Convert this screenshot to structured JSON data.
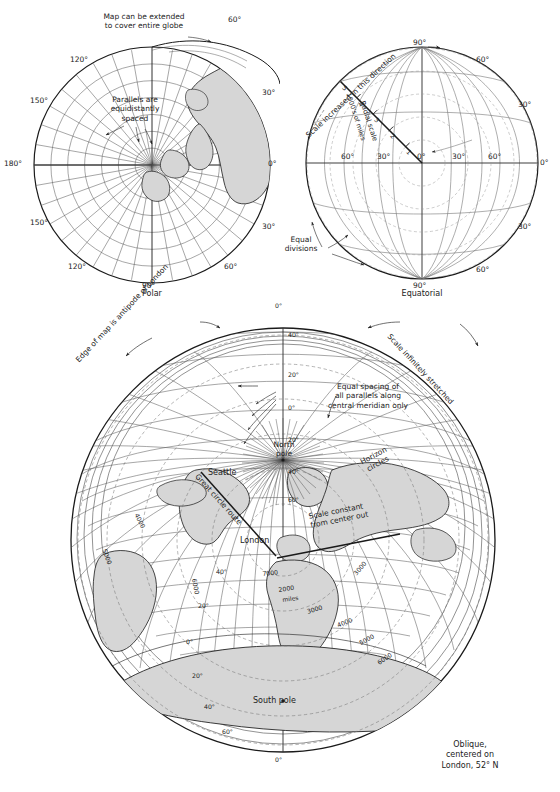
{
  "figure": {
    "header_faint": "",
    "panels": [
      {
        "id": "polar",
        "caption": "Polar"
      },
      {
        "id": "equatorial",
        "caption": "Equatorial"
      },
      {
        "id": "oblique",
        "caption": "Oblique,\ncentered on\nLondon, 52° N"
      }
    ]
  },
  "polar": {
    "caption": "Polar",
    "annotations": [
      {
        "name": "map-extent-note",
        "text": "Map can be extended\nto cover entire globe"
      },
      {
        "name": "parallels-note",
        "text": "Parallels are\nequidistantly\nspaced"
      }
    ],
    "meridian_labels": [
      {
        "text": "60°",
        "pos": "top-right"
      },
      {
        "text": "30°",
        "pos": "upper-right"
      },
      {
        "text": "0°",
        "pos": "right"
      },
      {
        "text": "30°",
        "pos": "lower-right"
      },
      {
        "text": "60°",
        "pos": "bottom-right"
      },
      {
        "text": "90°",
        "pos": "bottom"
      },
      {
        "text": "120°",
        "pos": "bottom-left"
      },
      {
        "text": "150°",
        "pos": "lower-left"
      },
      {
        "text": "180°",
        "pos": "left"
      },
      {
        "text": "150°",
        "pos": "upper-left"
      },
      {
        "text": "120°",
        "pos": "top-left"
      }
    ]
  },
  "equatorial": {
    "caption": "Equatorial",
    "annotations": [
      {
        "name": "scale-direction-note",
        "text": "Scale increased in this direction"
      },
      {
        "name": "radial-scale-label",
        "text": "Radial scale"
      },
      {
        "name": "radial-scale-units",
        "text": "1000's of miles"
      },
      {
        "name": "equal-divisions-note",
        "text": "Equal\ndivisions"
      }
    ],
    "radial_scale_ticks": [
      "1",
      "2",
      "3",
      "4",
      "5"
    ],
    "graticule_labels": [
      {
        "text": "90°",
        "pos": "top"
      },
      {
        "text": "60°",
        "pos": "upper-right"
      },
      {
        "text": "30°",
        "pos": "right-upper"
      },
      {
        "text": "0°",
        "pos": "right"
      },
      {
        "text": "30°",
        "pos": "right-lower"
      },
      {
        "text": "60°",
        "pos": "lower-right"
      },
      {
        "text": "90°",
        "pos": "bottom"
      },
      {
        "text": "60°",
        "pos": "equator-left-outer"
      },
      {
        "text": "30°",
        "pos": "equator-left-inner"
      },
      {
        "text": "0°",
        "pos": "equator-center"
      },
      {
        "text": "30°",
        "pos": "equator-right-inner"
      },
      {
        "text": "60°",
        "pos": "equator-right-outer"
      }
    ]
  },
  "oblique": {
    "caption": "Oblique,\ncentered on\nLondon, 52° N",
    "annotations": [
      {
        "name": "edge-antipode-note",
        "text": "Edge of map is antipode of London"
      },
      {
        "name": "scale-stretched-note",
        "text": "Scale infinitely stretched"
      },
      {
        "name": "equal-spacing-note",
        "text": "Equal spacing of\nall parallels along\ncentral meridian only"
      },
      {
        "name": "scale-constant-note",
        "text": "Scale constant\nfrom center out"
      },
      {
        "name": "great-circle-note",
        "text": "Great circle route"
      },
      {
        "name": "horizon-circles-note",
        "text": "Horizon\ncircles"
      }
    ],
    "place_labels": [
      {
        "name": "seattle",
        "text": "Seattle"
      },
      {
        "name": "london",
        "text": "London"
      },
      {
        "name": "north-pole",
        "text": "North\npole"
      },
      {
        "name": "south-pole",
        "text": "South pole"
      }
    ],
    "central_meridian_labels": [
      "0°",
      "40°",
      "20°",
      "0°",
      "20°",
      "40°",
      "60°",
      "40°",
      "20°",
      "0°",
      "20°",
      "40°",
      "60°",
      "0°"
    ],
    "distance_rings": [
      {
        "label": "2000",
        "units": "miles"
      },
      {
        "label": "3000",
        "units": ""
      },
      {
        "label": "4000",
        "units": ""
      },
      {
        "label": "5000",
        "units": ""
      },
      {
        "label": "6000",
        "units": ""
      },
      {
        "label": "7000",
        "units": ""
      }
    ],
    "latitude_tick_labels_left": [
      "40°",
      "20°",
      "0°",
      "20°",
      "40°",
      "60°"
    ],
    "latitude_tick_labels_bottom": [
      "40°",
      "60°"
    ]
  },
  "style": {
    "land_fill": "#d4d4d4",
    "graticule": "#5a5a5a",
    "outline": "#1a1a1a",
    "distance_ring": "#707070"
  }
}
